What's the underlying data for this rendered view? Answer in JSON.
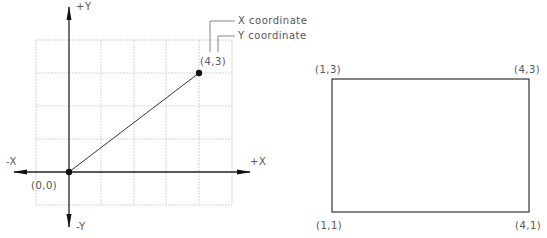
{
  "left_diagram": {
    "axes": {
      "pos_y": "+Y",
      "neg_y": "-Y",
      "pos_x": "+X",
      "neg_x": "-X"
    },
    "origin_label": "(0,0)",
    "point_label": "(4,3)",
    "callouts": {
      "x_coordinate": "X  coordinate",
      "y_coordinate": "Y  coordinate"
    },
    "line": {
      "from": [
        0,
        0
      ],
      "to": [
        4,
        3
      ]
    }
  },
  "right_diagram": {
    "corners": {
      "top_left": "(1,3)",
      "top_right": "(4,3)",
      "bottom_left": "(1,1)",
      "bottom_right": "(4,1)"
    }
  },
  "colors": {
    "line": "#222222",
    "grid": "#c8c8c8",
    "text": "#555555"
  }
}
